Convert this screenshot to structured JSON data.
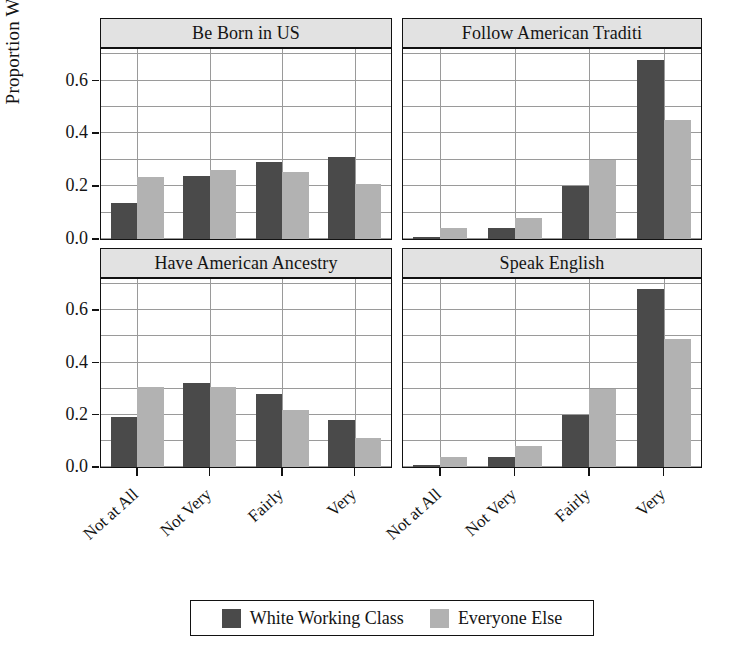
{
  "chart_data": {
    "type": "bar",
    "title": "",
    "xlabel": "",
    "ylabel": "Proportion Who Agree",
    "ylim": [
      0,
      0.72
    ],
    "yticks": [
      0.0,
      0.2,
      0.4,
      0.6
    ],
    "ytick_labels": [
      "0.0",
      "0.2",
      "0.4",
      "0.6"
    ],
    "gridlines": [
      0.0,
      0.1,
      0.2,
      0.3,
      0.4,
      0.5,
      0.6,
      0.7
    ],
    "grid": true,
    "categories": [
      "Not at All",
      "Not Very",
      "Fairly",
      "Very"
    ],
    "legend_position": "bottom",
    "series_names": [
      "White Working Class",
      "Everyone Else"
    ],
    "series_colors": [
      "#4a4a4a",
      "#b2b2b2"
    ],
    "panels": [
      {
        "title": "Be Born in US",
        "series": [
          {
            "name": "White Working Class",
            "values": [
              0.135,
              0.24,
              0.29,
              0.31
            ]
          },
          {
            "name": "Everyone Else",
            "values": [
              0.235,
              0.26,
              0.255,
              0.21
            ]
          }
        ]
      },
      {
        "title": "Follow American Traditi",
        "series": [
          {
            "name": "White Working Class",
            "values": [
              0.005,
              0.04,
              0.2,
              0.68
            ]
          },
          {
            "name": "Everyone Else",
            "values": [
              0.04,
              0.08,
              0.3,
              0.45
            ]
          }
        ]
      },
      {
        "title": "Have American Ancestry",
        "series": [
          {
            "name": "White Working Class",
            "values": [
              0.19,
              0.32,
              0.28,
              0.18
            ]
          },
          {
            "name": "Everyone Else",
            "values": [
              0.305,
              0.305,
              0.22,
              0.11
            ]
          }
        ]
      },
      {
        "title": "Speak English",
        "series": [
          {
            "name": "White Working Class",
            "values": [
              0.005,
              0.04,
              0.2,
              0.68
            ]
          },
          {
            "name": "Everyone Else",
            "values": [
              0.04,
              0.08,
              0.3,
              0.49
            ]
          }
        ]
      }
    ]
  },
  "legend": {
    "entries": [
      {
        "label": "White Working Class",
        "color": "#4a4a4a"
      },
      {
        "label": "Everyone Else",
        "color": "#b2b2b2"
      }
    ]
  },
  "axis": {
    "y_title": "Proportion Who Agree"
  }
}
